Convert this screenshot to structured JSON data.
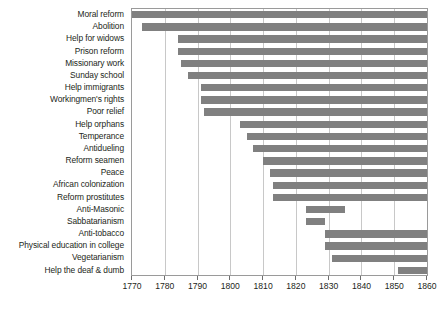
{
  "chart_data": {
    "type": "bar",
    "orientation": "horizontal",
    "subtype": "range-bar",
    "title": "",
    "subtitle": "",
    "xlabel": "",
    "ylabel": "",
    "xlim": [
      1770,
      1860
    ],
    "ylim": null,
    "grid": true,
    "grid_axis": "x",
    "legend": false,
    "legend_position": "none",
    "xticks": [
      1770,
      1780,
      1790,
      1800,
      1810,
      1820,
      1830,
      1840,
      1850,
      1860
    ],
    "xtick_labels": [
      "1770",
      "1780",
      "1790",
      "1800",
      "1810",
      "1820",
      "1830",
      "1840",
      "1850",
      "1860"
    ],
    "bar_color": "#808080",
    "plot_border_color": "#9a9a9a",
    "gridline_color": "#c8c8c8",
    "text_color": "#231f20",
    "categories": [
      "Moral reform",
      "Abolition",
      "Help for widows",
      "Prison reform",
      "Missionary work",
      "Sunday school",
      "Help immigrants",
      "Workingmen's rights",
      "Poor relief",
      "Help orphans",
      "Temperance",
      "Antidueling",
      "Reform seamen",
      "Peace",
      "African colonization",
      "Reform prostitutes",
      "Anti-Masonic",
      "Sabbatarianism",
      "Anti-tobacco",
      "Physical education in college",
      "Vegetarianism",
      "Help the deaf & dumb"
    ],
    "bars": [
      {
        "category": "Moral reform",
        "start": 1770,
        "end": 1860
      },
      {
        "category": "Abolition",
        "start": 1773,
        "end": 1860
      },
      {
        "category": "Help for widows",
        "start": 1784,
        "end": 1860
      },
      {
        "category": "Prison reform",
        "start": 1784,
        "end": 1860
      },
      {
        "category": "Missionary work",
        "start": 1785,
        "end": 1860
      },
      {
        "category": "Sunday school",
        "start": 1787,
        "end": 1860
      },
      {
        "category": "Help immigrants",
        "start": 1791,
        "end": 1860
      },
      {
        "category": "Workingmen's rights",
        "start": 1791,
        "end": 1860
      },
      {
        "category": "Poor relief",
        "start": 1792,
        "end": 1860
      },
      {
        "category": "Help orphans",
        "start": 1803,
        "end": 1860
      },
      {
        "category": "Temperance",
        "start": 1805,
        "end": 1860
      },
      {
        "category": "Antidueling",
        "start": 1807,
        "end": 1860
      },
      {
        "category": "Reform seamen",
        "start": 1810,
        "end": 1860
      },
      {
        "category": "Peace",
        "start": 1812,
        "end": 1860
      },
      {
        "category": "African colonization",
        "start": 1813,
        "end": 1860
      },
      {
        "category": "Reform prostitutes",
        "start": 1813,
        "end": 1860
      },
      {
        "category": "Anti-Masonic",
        "start": 1823,
        "end": 1835
      },
      {
        "category": "Sabbatarianism",
        "start": 1823,
        "end": 1829
      },
      {
        "category": "Anti-tobacco",
        "start": 1829,
        "end": 1860
      },
      {
        "category": "Physical education in college",
        "start": 1829,
        "end": 1860
      },
      {
        "category": "Vegetarianism",
        "start": 1831,
        "end": 1860
      },
      {
        "category": "Help the deaf & dumb",
        "start": 1851,
        "end": 1860
      }
    ]
  }
}
